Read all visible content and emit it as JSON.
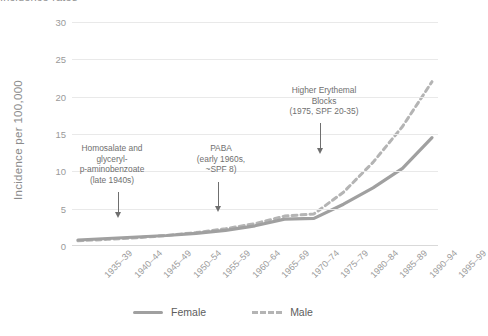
{
  "chart_title": "Incidence rates",
  "axes": {
    "y_label": "Incidence per 100,000",
    "y_ticks": [
      "0",
      "5",
      "10",
      "15",
      "20",
      "25",
      "30"
    ],
    "x_ticks": [
      "1935–39",
      "1940–44",
      "1945–49",
      "1950–54",
      "1955–59",
      "1960–64",
      "1965–69",
      "1970–74",
      "1975–79",
      "1980–84",
      "1985–89",
      "1990–94",
      "1995–99"
    ]
  },
  "legend": {
    "female_label": "Female",
    "male_label": "Male"
  },
  "annotations": [
    {
      "id": "homosalate",
      "text": "Homosalate and\nglyceryl-\np-aminobenzoate\n(late 1940s)"
    },
    {
      "id": "paba",
      "text": "PABA\n(early 1960s,\n~SPF 8)"
    },
    {
      "id": "erythemal",
      "text": "Higher Erythemal\nBlocks\n(1975, SPF 20-35)"
    }
  ],
  "colors": {
    "female_line": "#a0a0a0",
    "male_line": "#b4b4b4",
    "grid": "#e9e9e9",
    "text": "#8b8b8b"
  },
  "chart_data": {
    "type": "line",
    "title": "Incidence rates",
    "xlabel": "",
    "ylabel": "Incidence per 100,000",
    "ylim": [
      0,
      30
    ],
    "grid": true,
    "legend_position": "bottom",
    "categories": [
      "1935–39",
      "1940–44",
      "1945–49",
      "1950–54",
      "1955–59",
      "1960–64",
      "1965–69",
      "1970–74",
      "1975–79",
      "1980–84",
      "1985–89",
      "1990–94",
      "1995–99"
    ],
    "series": [
      {
        "name": "Female",
        "style": "solid",
        "values": [
          0.8,
          1.0,
          1.2,
          1.4,
          1.7,
          2.1,
          2.7,
          3.6,
          3.7,
          5.6,
          7.8,
          10.4,
          14.5
        ]
      },
      {
        "name": "Male",
        "style": "dashed",
        "values": [
          0.7,
          0.9,
          1.1,
          1.4,
          1.8,
          2.3,
          3.0,
          4.0,
          4.3,
          7.2,
          11.2,
          16.0,
          22.0
        ]
      }
    ],
    "annotations": [
      {
        "label": "Homosalate and glyceryl-p-aminobenzoate (late 1940s)",
        "at_category": "1945–49"
      },
      {
        "label": "PABA (early 1960s, ~SPF 8)",
        "at_category": "1960–64"
      },
      {
        "label": "Higher Erythemal Blocks (1975, SPF 20-35)",
        "at_category": "1975–79"
      }
    ]
  }
}
